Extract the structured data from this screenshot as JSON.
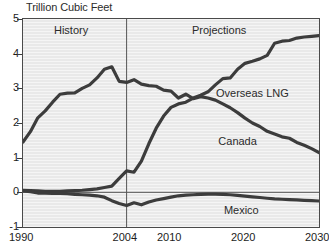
{
  "chart_data": {
    "type": "line",
    "title": "Trillion Cubic Feet",
    "xlabel": "",
    "ylabel": "",
    "xlim": [
      1990,
      2030
    ],
    "ylim": [
      -1,
      5
    ],
    "grid": false,
    "legend_position": "inline-annotations",
    "y_ticks": [
      "5",
      "4",
      "3",
      "2",
      "1",
      "0",
      "-1"
    ],
    "y_tick_values": [
      5,
      4,
      3,
      2,
      1,
      0,
      -1
    ],
    "x_ticks": [
      "1990",
      "2004",
      "2010",
      "2020",
      "2030"
    ],
    "x_tick_values": [
      1990,
      2004,
      2010,
      2020,
      2030
    ],
    "annotations": [
      {
        "text": "History",
        "x": 1996.5,
        "y": 4.65
      },
      {
        "text": "Projections",
        "x": 2016.5,
        "y": 4.65
      },
      {
        "text": "Overseas LNG",
        "x": 2021.0,
        "y": 2.85
      },
      {
        "text": "Canada",
        "x": 2019.0,
        "y": 1.45
      },
      {
        "text": "Mexico",
        "x": 2019.5,
        "y": -0.55
      }
    ],
    "divider_year": 2004,
    "zero_line": 0,
    "series": [
      {
        "name": "Canada",
        "color": "#3c3c3c",
        "x": [
          1990,
          1991,
          1992,
          1993,
          1994,
          1995,
          1996,
          1997,
          1998,
          1999,
          2000,
          2001,
          2002,
          2003,
          2004,
          2005,
          2006,
          2007,
          2008,
          2009,
          2010,
          2011,
          2012,
          2013,
          2014,
          2015,
          2016,
          2017,
          2018,
          2019,
          2020,
          2021,
          2022,
          2023,
          2024,
          2025,
          2026,
          2027,
          2028,
          2029,
          2030
        ],
        "values": [
          1.45,
          1.75,
          2.15,
          2.35,
          2.6,
          2.83,
          2.86,
          2.87,
          3.0,
          3.1,
          3.3,
          3.55,
          3.62,
          3.2,
          3.17,
          3.25,
          3.12,
          3.08,
          3.06,
          2.95,
          2.92,
          2.72,
          2.83,
          2.7,
          2.76,
          2.72,
          2.66,
          2.55,
          2.44,
          2.3,
          2.14,
          2.0,
          1.9,
          1.76,
          1.68,
          1.6,
          1.56,
          1.44,
          1.36,
          1.26,
          1.15
        ]
      },
      {
        "name": "Overseas LNG",
        "color": "#3c3c3c",
        "x": [
          1990,
          1991,
          1992,
          1993,
          1994,
          1995,
          1996,
          1997,
          1998,
          1999,
          2000,
          2001,
          2002,
          2003,
          2004,
          2005,
          2006,
          2007,
          2008,
          2009,
          2010,
          2011,
          2012,
          2013,
          2014,
          2015,
          2016,
          2017,
          2018,
          2019,
          2020,
          2021,
          2022,
          2023,
          2024,
          2025,
          2026,
          2027,
          2028,
          2029,
          2030
        ],
        "values": [
          0.06,
          0.05,
          0.04,
          0.03,
          0.03,
          0.03,
          0.04,
          0.05,
          0.06,
          0.08,
          0.1,
          0.14,
          0.18,
          0.4,
          0.62,
          0.58,
          0.9,
          1.4,
          1.85,
          2.2,
          2.45,
          2.55,
          2.6,
          2.72,
          2.8,
          2.9,
          3.1,
          3.28,
          3.3,
          3.55,
          3.72,
          3.78,
          3.85,
          3.95,
          4.3,
          4.36,
          4.38,
          4.45,
          4.48,
          4.5,
          4.52
        ]
      },
      {
        "name": "Mexico",
        "color": "#3c3c3c",
        "x": [
          1990,
          1991,
          1992,
          1993,
          1994,
          1995,
          1996,
          1997,
          1998,
          1999,
          2000,
          2001,
          2002,
          2003,
          2004,
          2005,
          2006,
          2007,
          2008,
          2009,
          2010,
          2011,
          2012,
          2013,
          2014,
          2015,
          2016,
          2017,
          2018,
          2019,
          2020,
          2021,
          2022,
          2023,
          2024,
          2025,
          2026,
          2027,
          2028,
          2029,
          2030
        ],
        "values": [
          0.04,
          0.02,
          -0.02,
          -0.02,
          -0.03,
          -0.03,
          -0.04,
          -0.06,
          -0.07,
          -0.08,
          -0.1,
          -0.14,
          -0.24,
          -0.32,
          -0.38,
          -0.3,
          -0.36,
          -0.28,
          -0.22,
          -0.18,
          -0.14,
          -0.1,
          -0.08,
          -0.07,
          -0.06,
          -0.05,
          -0.05,
          -0.06,
          -0.07,
          -0.09,
          -0.11,
          -0.13,
          -0.15,
          -0.17,
          -0.19,
          -0.2,
          -0.21,
          -0.22,
          -0.23,
          -0.24,
          -0.25
        ]
      }
    ]
  },
  "style": {
    "plot_background": "#e9e9e9",
    "frame_color": "#4a4a4a",
    "line_color": "#3c3c3c",
    "text_color": "#1c1c1c",
    "divider_color": "#555555"
  }
}
